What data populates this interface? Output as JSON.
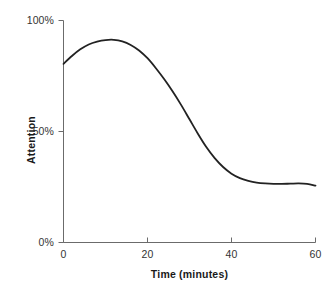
{
  "chart_data": {
    "type": "line",
    "title": "",
    "subtitle": "",
    "xlabel": "Time (minutes)",
    "ylabel": "Attention",
    "xlim": [
      0,
      60
    ],
    "ylim": [
      0,
      100
    ],
    "xticks": [
      0,
      20,
      40,
      60
    ],
    "xticklabels": [
      "0",
      "20",
      "40",
      "60"
    ],
    "yticks": [
      0,
      50,
      100
    ],
    "yticklabels": [
      "0%",
      "50%",
      "100%"
    ],
    "grid": false,
    "legend": null,
    "legend_position": "none",
    "line_color": "#222222",
    "line_width": 1.8,
    "axis_color": "#6b6b6b",
    "background": "#ffffff",
    "series": [
      {
        "name": "Attention",
        "x": [
          0,
          2,
          4,
          6,
          8,
          10,
          12,
          14,
          16,
          18,
          20,
          22,
          24,
          26,
          28,
          30,
          32,
          34,
          36,
          38,
          40,
          42,
          44,
          46,
          48,
          50,
          52,
          54,
          56,
          58,
          60
        ],
        "values": [
          80.5,
          84.0,
          87.0,
          89.2,
          90.5,
          91.2,
          91.3,
          90.6,
          89.0,
          86.5,
          83.0,
          78.5,
          73.5,
          68.0,
          62.0,
          55.5,
          49.0,
          43.0,
          38.0,
          34.0,
          31.0,
          29.0,
          27.8,
          27.0,
          26.6,
          26.4,
          26.4,
          26.5,
          26.6,
          26.4,
          25.6
        ]
      }
    ],
    "annotations": []
  },
  "axis": {
    "y_tick_100": "100%",
    "y_tick_50": "50%",
    "y_tick_0": "0%",
    "x_tick_0": "0",
    "x_tick_20": "20",
    "x_tick_40": "40",
    "x_tick_60": "60",
    "x_title": "Time (minutes)",
    "y_title": "Attention"
  }
}
